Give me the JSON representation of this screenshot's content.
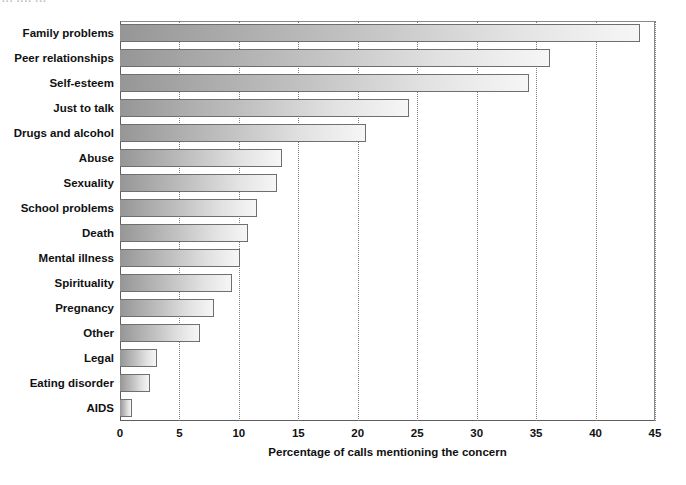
{
  "top_artifact": {
    "text": "··· ····  ···"
  },
  "chart_data": {
    "type": "bar",
    "orientation": "horizontal",
    "title": "",
    "xlabel": "Percentage of calls mentioning the concern",
    "ylabel": "",
    "xlim": [
      0,
      45
    ],
    "xticks": [
      0,
      5,
      10,
      15,
      20,
      25,
      30,
      35,
      40,
      45
    ],
    "xtick_labels": [
      "0",
      "5",
      "10",
      "15",
      "20",
      "25",
      "30",
      "35",
      "40",
      "45"
    ],
    "grid": "vertical-dotted",
    "legend": "none",
    "categories": [
      "Family problems",
      "Peer relationships",
      "Self-esteem",
      "Just to talk",
      "Drugs and alcohol",
      "Abuse",
      "Sexuality",
      "School problems",
      "Death",
      "Mental illness",
      "Spirituality",
      "Pregnancy",
      "Other",
      "Legal",
      "Eating disorder",
      "AIDS"
    ],
    "values": [
      43.7,
      36.2,
      34.4,
      24.3,
      20.7,
      13.6,
      13.2,
      11.5,
      10.8,
      10.1,
      9.4,
      7.9,
      6.7,
      3.1,
      2.5,
      1.0
    ],
    "colors": {
      "bar_gradient_start": "#969696",
      "bar_gradient_end": "#f6f6f6",
      "bar_border": "#6f6f6f",
      "axis": "#5d5d5d",
      "gridline": "#7d7d7d",
      "text": "#111111",
      "background": "#ffffff"
    }
  }
}
